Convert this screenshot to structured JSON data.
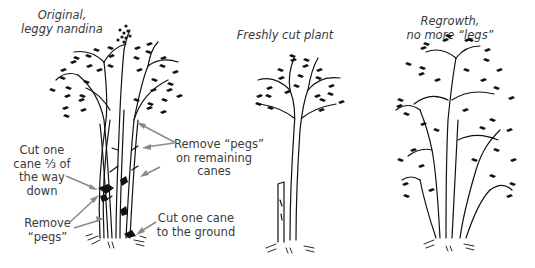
{
  "panels": [
    {
      "id": "original",
      "caption_lines": [
        "Original,",
        "leggy nandina"
      ]
    },
    {
      "id": "fresh-cut",
      "caption_lines": [
        "Freshly cut plant"
      ]
    },
    {
      "id": "regrowth",
      "caption_lines": [
        "Regrowth,",
        "no more “legs”"
      ]
    }
  ],
  "callouts": {
    "cut_two_thirds": [
      "Cut one",
      "cane ⅔ of",
      "the way",
      "down"
    ],
    "remove_pegs_left": [
      "Remove",
      "“pegs”"
    ],
    "remove_pegs_right": [
      "Remove “pegs”",
      "on remaining",
      "canes"
    ],
    "cut_to_ground": [
      "Cut one cane",
      "to the ground"
    ]
  },
  "colors": {
    "ink": "#111111",
    "arrow": "#8a8a8a",
    "text": "#3a3a3a",
    "background": "#ffffff"
  }
}
